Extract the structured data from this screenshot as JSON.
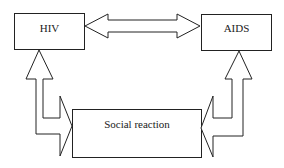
{
  "diagram": {
    "nodes": [
      {
        "id": "hiv",
        "label": "HIV"
      },
      {
        "id": "aids",
        "label": "AIDS"
      },
      {
        "id": "social",
        "label": "Social reaction"
      }
    ],
    "edges": [
      {
        "from": "hiv",
        "to": "aids",
        "type": "bidirectional"
      },
      {
        "from": "social",
        "to": "hiv",
        "type": "bidirectional"
      },
      {
        "from": "social",
        "to": "aids",
        "type": "bidirectional"
      }
    ],
    "colors": {
      "stroke": "#222222",
      "fill": "#ffffff"
    }
  }
}
